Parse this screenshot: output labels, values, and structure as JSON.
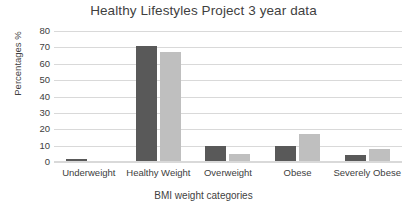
{
  "chart_data": {
    "type": "bar",
    "title": "Healthy Lifestyles Project 3 year data",
    "xlabel": "BMI weight categories",
    "ylabel": "Percentages %",
    "categories": [
      "Underweight",
      "Healthy Weight",
      "Overweight",
      "Obese",
      "Severely Obese"
    ],
    "series": [
      {
        "name": "Series 1",
        "color": "#595959",
        "values": [
          2,
          71,
          10,
          10,
          4
        ]
      },
      {
        "name": "Series 2",
        "color": "#bfbfbf",
        "values": [
          0,
          67,
          5,
          17,
          8
        ]
      }
    ],
    "ylim": [
      0,
      80
    ],
    "ytick_labels": [
      "80",
      "70",
      "60",
      "50",
      "40",
      "30",
      "20",
      "10",
      "0"
    ],
    "ytick_values": [
      80,
      70,
      60,
      50,
      40,
      30,
      20,
      10,
      0
    ],
    "ytick_step": 10,
    "grid": true,
    "legend": false,
    "gridline_color": "#d9d9d9",
    "background_color": "#ffffff",
    "text_color": "#404040"
  }
}
